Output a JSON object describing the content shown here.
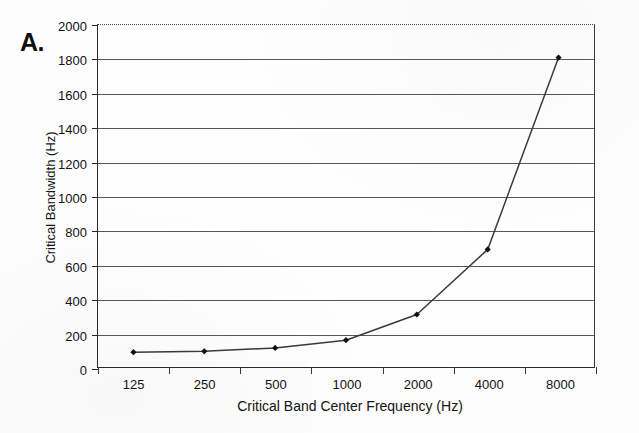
{
  "figure": {
    "panel_label": "A.",
    "background_color": "#fdfdfd",
    "line_color": "#3a3a3a",
    "marker_color": "#111111",
    "grid_color": "#585858",
    "axis_color": "#2a2a2a"
  },
  "chart_data": {
    "type": "line",
    "title": "",
    "subtitle": "",
    "xlabel": "Critical Band Center Frequency (Hz)",
    "ylabel": "Critical Bandwidth (Hz)",
    "categories": [
      "125",
      "250",
      "500",
      "1000",
      "2000",
      "4000",
      "8000"
    ],
    "x_values": [
      125,
      250,
      500,
      1000,
      2000,
      4000,
      8000
    ],
    "values": [
      90,
      95,
      115,
      160,
      310,
      690,
      1810
    ],
    "series": [
      {
        "name": "Critical Bandwidth",
        "values": [
          90,
          95,
          115,
          160,
          310,
          690,
          1810
        ]
      }
    ],
    "ylim": [
      0,
      2000
    ],
    "y_ticks": [
      0,
      200,
      400,
      600,
      800,
      1000,
      1200,
      1400,
      1600,
      1800,
      2000
    ],
    "y_tick_labels": [
      "0",
      "200",
      "400",
      "600",
      "800",
      "1000",
      "1200",
      "1400",
      "1600",
      "1800",
      "2000"
    ],
    "x_tick_labels": [
      "125",
      "250",
      "500",
      "1000",
      "2000",
      "4000",
      "8000"
    ],
    "x_scale": "category",
    "grid": "horizontal",
    "legend": "none",
    "marker": "diamond",
    "annotations": [
      "A."
    ]
  }
}
